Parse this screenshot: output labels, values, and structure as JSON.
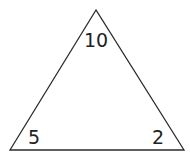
{
  "diagram": {
    "shape": "triangle",
    "stroke_color": "#2a2a2a",
    "fill_color": "#ffffff",
    "vertices": {
      "top": {
        "x": 96,
        "y": 10
      },
      "bottom_left": {
        "x": 10,
        "y": 150
      },
      "bottom_right": {
        "x": 184,
        "y": 150
      }
    },
    "labels": {
      "top": "10",
      "bottom_left": "5",
      "bottom_right": "2"
    }
  }
}
